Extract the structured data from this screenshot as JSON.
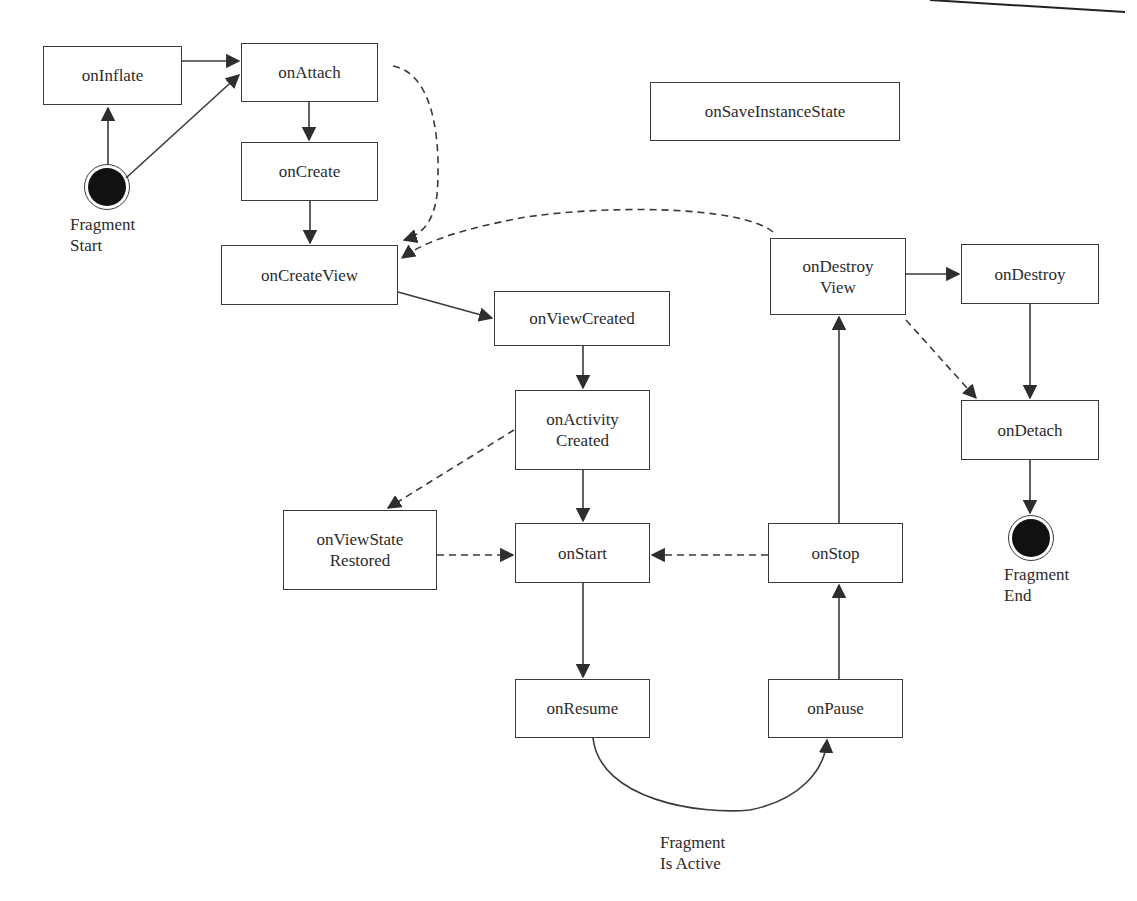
{
  "diagram": {
    "colors": {
      "stroke": "#3a3a3a",
      "text": "#2b2b2b",
      "fill_terminal": "#111111",
      "background": "#ffffff"
    },
    "nodes": [
      {
        "id": "onInflate",
        "lines": [
          "onInflate"
        ],
        "box": [
          43,
          46,
          139,
          59
        ]
      },
      {
        "id": "onAttach",
        "lines": [
          "onAttach"
        ],
        "box": [
          241,
          43,
          137,
          59
        ]
      },
      {
        "id": "onCreate",
        "lines": [
          "onCreate"
        ],
        "box": [
          241,
          142,
          137,
          59
        ]
      },
      {
        "id": "onCreateView",
        "lines": [
          "onCreateView"
        ],
        "box": [
          221,
          245,
          177,
          60
        ]
      },
      {
        "id": "onViewCreated",
        "lines": [
          "onViewCreated"
        ],
        "box": [
          494,
          291,
          176,
          55
        ]
      },
      {
        "id": "onActivityCreated",
        "lines": [
          "onActivity",
          "Created"
        ],
        "box": [
          515,
          390,
          135,
          80
        ]
      },
      {
        "id": "onViewStateRestored",
        "lines": [
          "onViewState",
          "Restored"
        ],
        "box": [
          283,
          510,
          154,
          80
        ]
      },
      {
        "id": "onStart",
        "lines": [
          "onStart"
        ],
        "box": [
          515,
          523,
          135,
          60
        ]
      },
      {
        "id": "onStop",
        "lines": [
          "onStop"
        ],
        "box": [
          768,
          523,
          135,
          60
        ]
      },
      {
        "id": "onResume",
        "lines": [
          "onResume"
        ],
        "box": [
          515,
          679,
          135,
          59
        ]
      },
      {
        "id": "onPause",
        "lines": [
          "onPause"
        ],
        "box": [
          768,
          679,
          135,
          59
        ]
      },
      {
        "id": "onSaveInstanceState",
        "lines": [
          "onSaveInstanceState"
        ],
        "box": [
          650,
          82,
          250,
          59
        ]
      },
      {
        "id": "onDestroyView",
        "lines": [
          "onDestroy",
          "View"
        ],
        "box": [
          770,
          238,
          136,
          77
        ]
      },
      {
        "id": "onDestroy",
        "lines": [
          "onDestroy"
        ],
        "box": [
          961,
          244,
          138,
          60
        ]
      },
      {
        "id": "onDetach",
        "lines": [
          "onDetach"
        ],
        "box": [
          961,
          400,
          138,
          60
        ]
      }
    ],
    "terminals": [
      {
        "id": "fragment-start",
        "label_lines": [
          "Fragment",
          "Start"
        ],
        "center": [
          107,
          187
        ],
        "radius": 22,
        "label_pos": [
          70,
          213
        ]
      },
      {
        "id": "fragment-end",
        "label_lines": [
          "Fragment",
          "End"
        ],
        "center": [
          1031,
          538
        ],
        "radius": 22,
        "label_pos": [
          1004,
          564
        ]
      }
    ],
    "annotations": [
      {
        "id": "fragment-is-active",
        "lines": [
          "Fragment",
          "Is Active"
        ],
        "pos": [
          660,
          832
        ]
      }
    ],
    "edges": [
      {
        "from": "onInflate",
        "to": "onAttach",
        "style": "solid"
      },
      {
        "from": "fragment-start",
        "to": "onInflate",
        "style": "solid"
      },
      {
        "from": "fragment-start",
        "to": "onAttach",
        "style": "solid"
      },
      {
        "from": "onAttach",
        "to": "onCreate",
        "style": "solid"
      },
      {
        "from": "onCreate",
        "to": "onCreateView",
        "style": "solid"
      },
      {
        "from": "onAttach",
        "to": "onCreateView",
        "style": "dashed"
      },
      {
        "from": "onDestroyView",
        "to": "onCreateView",
        "style": "dashed"
      },
      {
        "from": "onCreateView",
        "to": "onViewCreated",
        "style": "solid"
      },
      {
        "from": "onViewCreated",
        "to": "onActivityCreated",
        "style": "solid"
      },
      {
        "from": "onActivityCreated",
        "to": "onStart",
        "style": "solid"
      },
      {
        "from": "onActivityCreated",
        "to": "onViewStateRestored",
        "style": "dashed"
      },
      {
        "from": "onViewStateRestored",
        "to": "onStart",
        "style": "dashed"
      },
      {
        "from": "onStop",
        "to": "onStart",
        "style": "dashed"
      },
      {
        "from": "onStart",
        "to": "onResume",
        "style": "solid"
      },
      {
        "from": "onResume",
        "to": "onPause",
        "style": "solid-curved",
        "label": "Fragment Is Active"
      },
      {
        "from": "onPause",
        "to": "onStop",
        "style": "solid"
      },
      {
        "from": "onStop",
        "to": "onDestroyView",
        "style": "solid"
      },
      {
        "from": "onDestroyView",
        "to": "onDestroy",
        "style": "solid"
      },
      {
        "from": "onDestroyView",
        "to": "onDetach",
        "style": "dashed"
      },
      {
        "from": "onDestroy",
        "to": "onDetach",
        "style": "solid"
      },
      {
        "from": "onDetach",
        "to": "fragment-end",
        "style": "solid"
      }
    ]
  }
}
